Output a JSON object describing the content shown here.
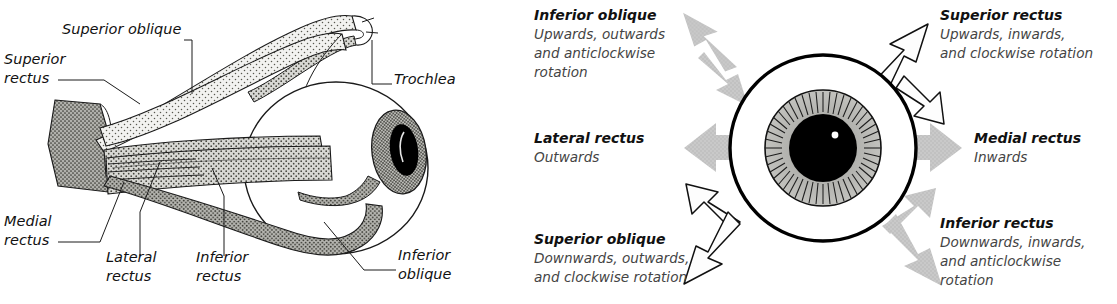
{
  "figure": {
    "panels": [
      "anatomy-diagram",
      "actions-diagram"
    ]
  },
  "left_panel": {
    "name": "extraocular-muscle-anatomy",
    "labels": [
      {
        "id": "superior-oblique",
        "lines": [
          "Superior oblique"
        ],
        "x": 62,
        "y": 34
      },
      {
        "id": "superior-rectus",
        "lines": [
          "Superior",
          "rectus"
        ],
        "x": 4,
        "y": 66
      },
      {
        "id": "trochlea",
        "lines": [
          "Trochlea"
        ],
        "x": 394,
        "y": 78
      },
      {
        "id": "medial-rectus",
        "lines": [
          "Medial",
          "rectus"
        ],
        "x": 4,
        "y": 228
      },
      {
        "id": "lateral-rectus",
        "lines": [
          "Lateral",
          "rectus"
        ],
        "x": 106,
        "y": 264
      },
      {
        "id": "inferior-rectus",
        "lines": [
          "Inferior",
          "rectus"
        ],
        "x": 196,
        "y": 264
      },
      {
        "id": "inferior-oblique",
        "lines": [
          "Inferior",
          "oblique"
        ],
        "x": 398,
        "y": 262
      }
    ],
    "colors": {
      "outline": "#1a1a1a",
      "muscle_light": "#eeeeec",
      "muscle_mid": "#c9c9c6",
      "muscle_dark": "#a8a8a4",
      "sclera": "#ffffff",
      "iris": "#b4b4b0",
      "pupil": "#000000"
    }
  },
  "right_panel": {
    "name": "muscle-action-diagram",
    "eye": {
      "sclera_color": "#ffffff",
      "iris_color": "#b0b0ac",
      "pupil_color": "#000000",
      "outline_color": "#000000",
      "highlight_color": "#ffffff"
    },
    "arrow_colors": {
      "gray": "#c6c6c6",
      "white": "#fbfbfb",
      "white_outline": "#111111"
    },
    "muscles": [
      {
        "id": "inferior-oblique",
        "name": "Inferior oblique",
        "action_lines": [
          "Upwards, outwards",
          "and anticlockwise",
          "rotation"
        ],
        "position": "top-left",
        "arrow_style": "gray"
      },
      {
        "id": "superior-rectus",
        "name": "Superior rectus",
        "action_lines": [
          "Upwards, inwards,",
          "and clockwise rotation"
        ],
        "position": "top-right",
        "arrow_style": "white"
      },
      {
        "id": "lateral-rectus",
        "name": "Lateral rectus",
        "action_lines": [
          "Outwards"
        ],
        "position": "left",
        "arrow_style": "gray"
      },
      {
        "id": "medial-rectus",
        "name": "Medial rectus",
        "action_lines": [
          "Inwards"
        ],
        "position": "right",
        "arrow_style": "gray"
      },
      {
        "id": "superior-oblique",
        "name": "Superior oblique",
        "action_lines": [
          "Downwards, outwards,",
          "and clockwise rotation"
        ],
        "position": "bottom-left",
        "arrow_style": "white"
      },
      {
        "id": "inferior-rectus",
        "name": "Inferior rectus",
        "action_lines": [
          "Downwards, inwards,",
          "and anticlockwise",
          "rotation"
        ],
        "position": "bottom-right",
        "arrow_style": "gray"
      }
    ]
  }
}
